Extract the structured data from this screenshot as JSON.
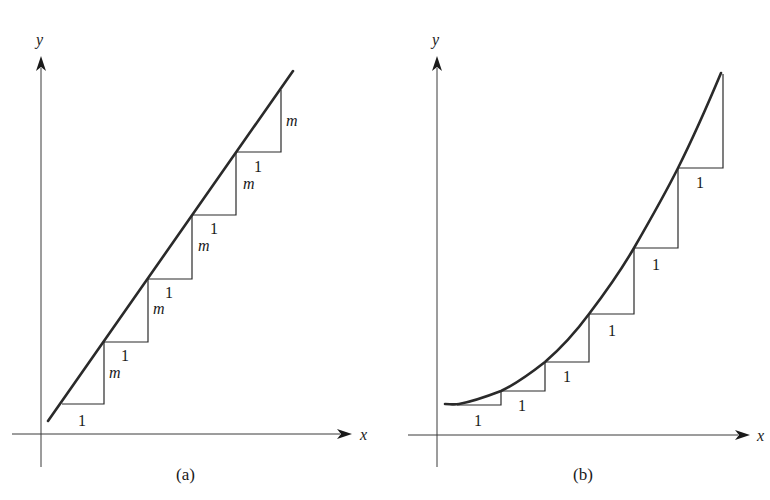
{
  "figure": {
    "panels": [
      {
        "id": "a",
        "caption": "(a)",
        "x_axis_label": "x",
        "y_axis_label": "y",
        "curve": "straight line with constant slope m",
        "run_label": "1",
        "rise_label": "m",
        "steps": [
          {
            "run": "1",
            "rise": "m"
          },
          {
            "run": "1",
            "rise": "m"
          },
          {
            "run": "1",
            "rise": "m"
          },
          {
            "run": "1",
            "rise": "m"
          },
          {
            "run": "1",
            "rise": "m"
          }
        ]
      },
      {
        "id": "b",
        "caption": "(b)",
        "x_axis_label": "x",
        "y_axis_label": "y",
        "curve": "increasing convex curve with growing rise per unit run",
        "run_label": "1",
        "steps": [
          {
            "run": "1"
          },
          {
            "run": "1"
          },
          {
            "run": "1"
          },
          {
            "run": "1"
          },
          {
            "run": "1"
          },
          {
            "run": "1"
          }
        ]
      }
    ]
  },
  "colors": {
    "ink": "#1a1a1a",
    "background": "#ffffff"
  }
}
